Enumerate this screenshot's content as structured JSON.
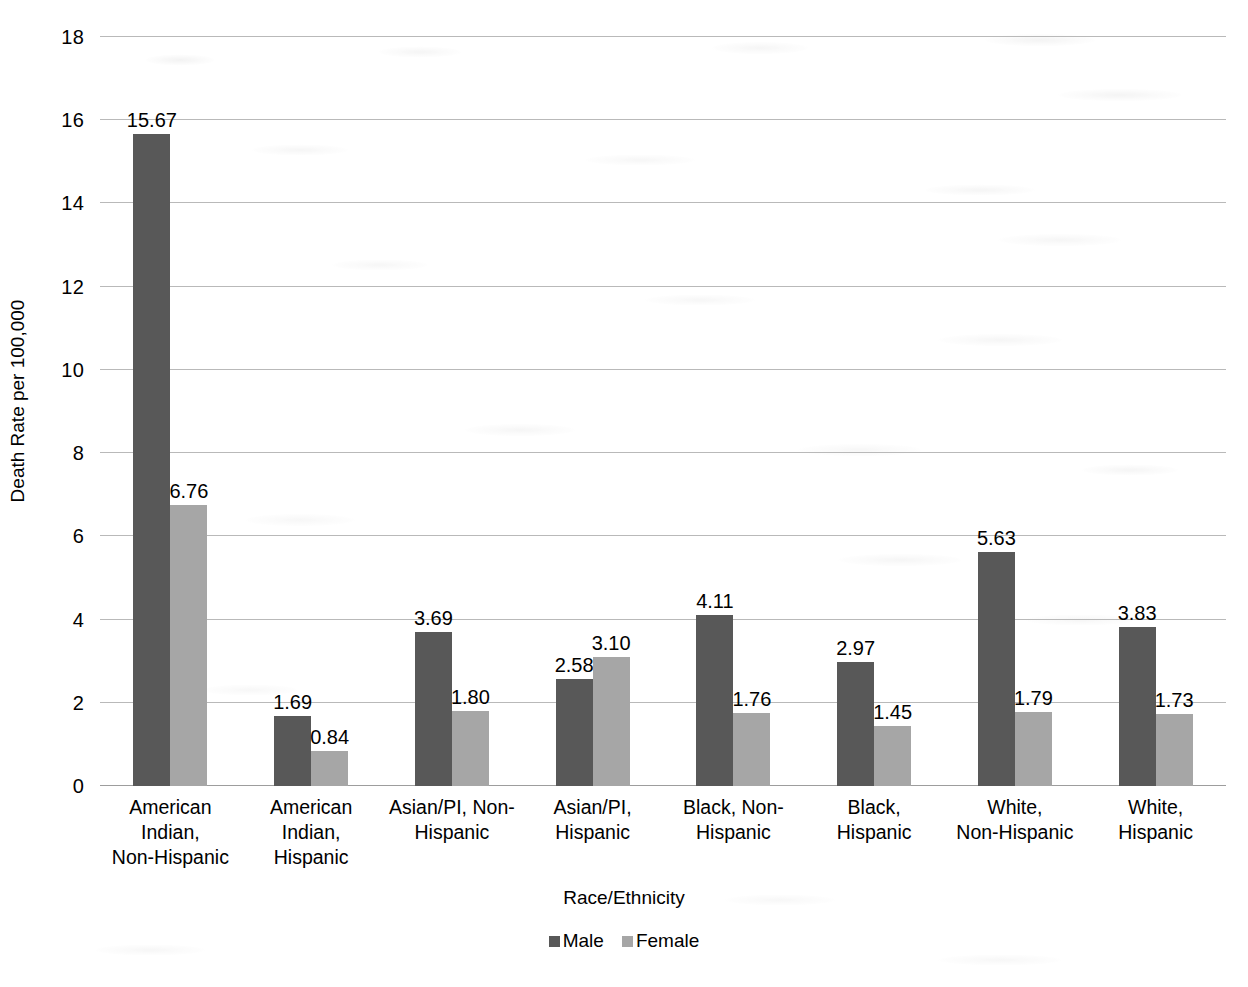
{
  "chart_data": {
    "type": "bar",
    "title": "",
    "xlabel": "Race/Ethnicity",
    "ylabel": "Death Rate per 100,000",
    "ylim": [
      0,
      18
    ],
    "yticks": [
      0,
      2,
      4,
      6,
      8,
      10,
      12,
      14,
      16,
      18
    ],
    "ytick_labels": [
      "0",
      "2",
      "4",
      "6",
      "8",
      "10",
      "12",
      "14",
      "16",
      "18"
    ],
    "grid": true,
    "legend_position": "bottom",
    "categories": [
      "American Indian, Non-Hispanic",
      "American Indian, Hispanic",
      "Asian/PI, Non-Hispanic",
      "Asian/PI, Hispanic",
      "Black, Non-Hispanic",
      "Black, Hispanic",
      "White, Non-Hispanic",
      "White, Hispanic"
    ],
    "category_label_lines": [
      "American\nIndian,\nNon-Hispanic",
      "American\nIndian,\nHispanic",
      "Asian/PI, Non-\nHispanic",
      "Asian/PI,\nHispanic",
      "Black, Non-\nHispanic",
      "Black,\nHispanic",
      "White,\nNon-Hispanic",
      "White,\nHispanic"
    ],
    "series": [
      {
        "name": "Male",
        "color": "#585858",
        "values": [
          15.67,
          1.69,
          3.69,
          2.58,
          4.11,
          2.97,
          5.63,
          3.83
        ],
        "value_labels": [
          "15.67",
          "1.69",
          "3.69",
          "2.58",
          "4.11",
          "2.97",
          "5.63",
          "3.83"
        ]
      },
      {
        "name": "Female",
        "color": "#a6a6a6",
        "values": [
          6.76,
          0.84,
          1.8,
          3.1,
          1.76,
          1.45,
          1.79,
          1.73
        ],
        "value_labels": [
          "6.76",
          "0.84",
          "1.80",
          "3.10",
          "1.76",
          "1.45",
          "1.79",
          "1.73"
        ]
      }
    ]
  },
  "legend": {
    "items": [
      {
        "label": "Male",
        "color": "#585858"
      },
      {
        "label": "Female",
        "color": "#a6a6a6"
      }
    ]
  },
  "axes": {
    "y_title": "Death Rate per 100,000",
    "x_title": "Race/Ethnicity"
  },
  "colors": {
    "male_bar": "#585858",
    "female_bar": "#a6a6a6",
    "gridline": "#b9b9b9",
    "text": "#000000",
    "background": "#ffffff"
  }
}
